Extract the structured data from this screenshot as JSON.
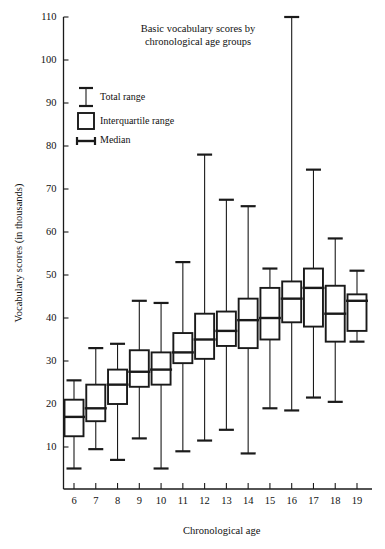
{
  "chart_data": {
    "type": "box",
    "title_line1": "Basic vocabulary scores by",
    "title_line2": "chronological age groups",
    "xlabel": "Chronological age",
    "ylabel": "Vocabulary scores (in thousands)",
    "xlim": [
      5.4,
      19.7
    ],
    "ylim": [
      0,
      110
    ],
    "ytick_labels": [
      "10",
      "20",
      "30",
      "40",
      "50",
      "60",
      "70",
      "80",
      "90",
      "100",
      "110"
    ],
    "yticks": [
      10,
      20,
      30,
      40,
      50,
      60,
      70,
      80,
      90,
      100,
      110
    ],
    "xtick_labels": [
      "6",
      "7",
      "8",
      "9",
      "10",
      "11",
      "12",
      "13",
      "14",
      "15",
      "16",
      "17",
      "18",
      "19"
    ],
    "categories": [
      6,
      7,
      8,
      9,
      10,
      11,
      12,
      13,
      14,
      15,
      16,
      17,
      18,
      19
    ],
    "grid": false,
    "legend_position": "upper-left",
    "legend": [
      {
        "key": "total-range",
        "label": "Total range"
      },
      {
        "key": "interquartile-range",
        "label": "Interquartile range"
      },
      {
        "key": "median",
        "label": "Median"
      }
    ],
    "boxes": [
      {
        "age": 6,
        "min": 5.0,
        "q1": 12.5,
        "median": 17.0,
        "q3": 21.0,
        "max": 25.5
      },
      {
        "age": 7,
        "min": 9.5,
        "q1": 16.0,
        "median": 19.0,
        "q3": 24.5,
        "max": 33.0
      },
      {
        "age": 8,
        "min": 7.0,
        "q1": 20.0,
        "median": 24.5,
        "q3": 28.0,
        "max": 34.0
      },
      {
        "age": 9,
        "min": 12.0,
        "q1": 24.0,
        "median": 27.5,
        "q3": 32.5,
        "max": 44.0
      },
      {
        "age": 10,
        "min": 5.0,
        "q1": 24.5,
        "median": 28.0,
        "q3": 32.0,
        "max": 43.5
      },
      {
        "age": 11,
        "min": 9.0,
        "q1": 29.5,
        "median": 32.0,
        "q3": 36.5,
        "max": 53.0
      },
      {
        "age": 12,
        "min": 11.5,
        "q1": 30.5,
        "median": 35.0,
        "q3": 41.0,
        "max": 78.0
      },
      {
        "age": 13,
        "min": 14.0,
        "q1": 33.5,
        "median": 37.0,
        "q3": 41.5,
        "max": 67.5
      },
      {
        "age": 14,
        "min": 8.5,
        "q1": 33.0,
        "median": 39.5,
        "q3": 44.5,
        "max": 66.0
      },
      {
        "age": 15,
        "min": 19.0,
        "q1": 35.0,
        "median": 40.0,
        "q3": 47.0,
        "max": 51.5
      },
      {
        "age": 16,
        "min": 18.5,
        "q1": 39.0,
        "median": 44.5,
        "q3": 48.5,
        "max": 110.0
      },
      {
        "age": 17,
        "min": 21.5,
        "q1": 38.0,
        "median": 47.0,
        "q3": 51.5,
        "max": 74.5
      },
      {
        "age": 18,
        "min": 20.5,
        "q1": 34.5,
        "median": 41.0,
        "q3": 47.5,
        "max": 58.5
      },
      {
        "age": 19,
        "min": 34.5,
        "q1": 37.0,
        "median": 44.0,
        "q3": 45.5,
        "max": 51.0
      }
    ]
  }
}
